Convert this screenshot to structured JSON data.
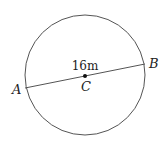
{
  "diagram": {
    "type": "circle-with-diameter",
    "circle": {
      "cx": 85,
      "cy": 75,
      "r": 60,
      "stroke": "#555555"
    },
    "diameter": {
      "x1": 25,
      "y1": 88,
      "x2": 145,
      "y2": 64,
      "stroke": "#555555"
    },
    "center_point": {
      "x": 85,
      "y": 76,
      "color": "#111111"
    },
    "labels": {
      "point_a": "A",
      "point_b": "B",
      "center": "C",
      "length": "16m"
    }
  }
}
